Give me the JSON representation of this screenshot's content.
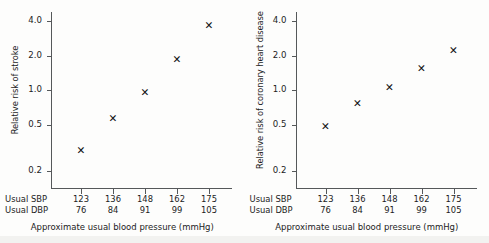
{
  "figure": {
    "background_color": "#fdfdfc",
    "axis_color": "#55585a",
    "marker_color": "#111111",
    "marker_glyph": "✕"
  },
  "chart_data": [
    {
      "type": "scatter",
      "panel_id": "stroke",
      "title": "",
      "ylabel": "Relative risk of stroke",
      "xlabel": "Approximate usual blood pressure (mmHg)",
      "yscale": "log",
      "ylim": [
        0.15,
        4.6
      ],
      "yticks": [
        0.2,
        0.5,
        1.0,
        2.0,
        4.0
      ],
      "ytick_labels": [
        "0.2",
        "0.5",
        "1.0",
        "2.0",
        "4.0"
      ],
      "grid": false,
      "legend": null,
      "x": [
        123,
        136,
        148,
        162,
        175
      ],
      "x_categories": [
        "123",
        "136",
        "148",
        "162",
        "175"
      ],
      "values": [
        0.3,
        0.57,
        0.95,
        1.85,
        3.65
      ],
      "x_axis_rows": [
        {
          "label": "Usual SBP",
          "values": [
            "123",
            "136",
            "148",
            "162",
            "175"
          ]
        },
        {
          "label": "Usual DBP",
          "values": [
            "76",
            "84",
            "91",
            "99",
            "105"
          ]
        }
      ]
    },
    {
      "type": "scatter",
      "panel_id": "chd",
      "title": "",
      "ylabel": "Relative risk of coronary heart disease",
      "xlabel": "Approximate usual blood pressure (mmHg)",
      "yscale": "log",
      "ylim": [
        0.15,
        4.6
      ],
      "yticks": [
        0.2,
        0.5,
        1.0,
        2.0,
        4.0
      ],
      "ytick_labels": [
        "0.2",
        "0.5",
        "1.0",
        "2.0",
        "4.0"
      ],
      "grid": false,
      "legend": null,
      "x": [
        123,
        136,
        148,
        162,
        175
      ],
      "x_categories": [
        "123",
        "136",
        "148",
        "162",
        "175"
      ],
      "values": [
        0.48,
        0.76,
        1.05,
        1.55,
        2.2
      ],
      "x_axis_rows": [
        {
          "label": "Usual SBP",
          "values": [
            "123",
            "136",
            "148",
            "162",
            "175"
          ]
        },
        {
          "label": "Usual DBP",
          "values": [
            "76",
            "84",
            "91",
            "99",
            "105"
          ]
        }
      ]
    }
  ]
}
